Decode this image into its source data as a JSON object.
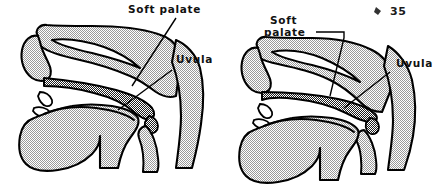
{
  "figure": {
    "number": "35",
    "tick_mark": "⸮",
    "background_color": "#ffffff",
    "ink_color": "#000000",
    "stipple_color": "#8a8a8a",
    "hatch_color": "#2b2b2b"
  },
  "panels": [
    {
      "id": "left",
      "name": "velum-lowered",
      "labels": [
        {
          "name": "soft-palate",
          "lines": [
            "Soft palate"
          ],
          "x": 128,
          "y": 12
        },
        {
          "name": "uvula",
          "lines": [
            "Uvula"
          ],
          "x": 172,
          "y": 62
        }
      ]
    },
    {
      "id": "right",
      "name": "velum-raised",
      "labels": [
        {
          "name": "soft-palate",
          "lines": [
            "Soft",
            "palate"
          ],
          "x": 268,
          "y": 24
        },
        {
          "name": "uvula",
          "lines": [
            "Uvula"
          ],
          "x": 392,
          "y": 66
        }
      ]
    }
  ],
  "caption_number": "35"
}
